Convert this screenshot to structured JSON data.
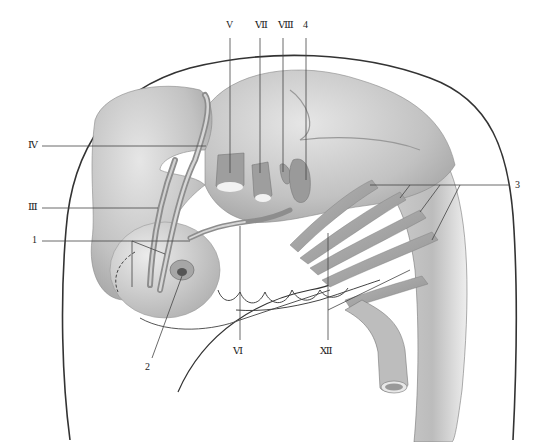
{
  "figure": {
    "labels": [
      {
        "id": "V",
        "text": "V",
        "x": 226,
        "y": 28
      },
      {
        "id": "VII",
        "text": "Ⅶ",
        "x": 256,
        "y": 28
      },
      {
        "id": "VIII",
        "text": "Ⅷ",
        "x": 279,
        "y": 28
      },
      {
        "id": "4",
        "text": "4",
        "x": 303,
        "y": 28
      },
      {
        "id": "IV",
        "text": "Ⅳ",
        "x": 28,
        "y": 141
      },
      {
        "id": "III",
        "text": "Ⅲ",
        "x": 28,
        "y": 203
      },
      {
        "id": "1",
        "text": "1",
        "x": 32,
        "y": 236
      },
      {
        "id": "3",
        "text": "3",
        "x": 517,
        "y": 181
      },
      {
        "id": "2",
        "text": "2",
        "x": 145,
        "y": 363
      },
      {
        "id": "VI",
        "text": "Ⅵ",
        "x": 232,
        "y": 347
      },
      {
        "id": "XII",
        "text": "Ⅻ",
        "x": 318,
        "y": 347
      }
    ]
  },
  "colors": {
    "tissue": "#c9c9c9",
    "tissue_light": "#e2e2e2",
    "tissue_dark": "#9a9a9a",
    "outline": "#333333",
    "leader": "#444444"
  }
}
